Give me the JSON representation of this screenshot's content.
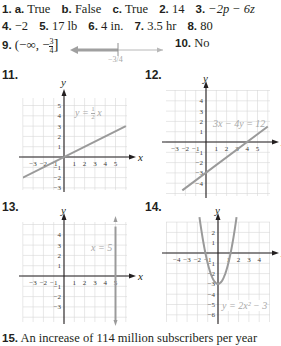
{
  "answers": {
    "line1": [
      {
        "num": "1.",
        "sub": [
          {
            "label": "a.",
            "value": "True"
          },
          {
            "label": "b.",
            "value": "False"
          },
          {
            "label": "c.",
            "value": "True"
          }
        ]
      },
      {
        "num": "2.",
        "value": "14"
      },
      {
        "num": "3.",
        "value": "−2p − 6z"
      }
    ],
    "line2": [
      {
        "num": "4.",
        "value": "−2"
      },
      {
        "num": "5.",
        "value": "17 lb"
      },
      {
        "num": "6.",
        "value": "4 in."
      },
      {
        "num": "7.",
        "value": "3.5 hr"
      },
      {
        "num": "8.",
        "value": "80"
      }
    ],
    "line3": {
      "q9": {
        "num": "9.",
        "value": "(−∞, −3/4]",
        "interval_open": "(−∞, −",
        "frac_num": "3",
        "frac_den": "4",
        "interval_close": "]",
        "numberline_label": "−3/4"
      },
      "q10": {
        "num": "10.",
        "value": "No"
      }
    },
    "q15": {
      "num": "15.",
      "value": "An increase of 114 million subscribers per year"
    }
  },
  "chart_data": [
    {
      "id": "11",
      "type": "line",
      "title": "11.",
      "equation": "y = 1/2 x",
      "eq_num": "1",
      "eq_den": "2",
      "xlabel": "x",
      "ylabel": "y",
      "xlim": [
        -3.5,
        5.8
      ],
      "ylim": [
        -3.5,
        5.8
      ],
      "xticks": [
        -3,
        -2,
        -1,
        1,
        2,
        3,
        4,
        5
      ],
      "yticks": [
        -3,
        -2,
        -1,
        1,
        2,
        3,
        4,
        5
      ],
      "x": [
        -4,
        6
      ],
      "y": [
        -2,
        3
      ],
      "grid": true
    },
    {
      "id": "12",
      "type": "line",
      "title": "12.",
      "equation": "3x − 4y = 12",
      "xlabel": "x",
      "ylabel": "y",
      "xlim": [
        -3.5,
        5.8
      ],
      "ylim": [
        -5,
        4.8
      ],
      "xticks": [
        -3,
        -2,
        -1,
        1,
        2,
        3,
        4,
        5
      ],
      "yticks": [
        -4,
        -3,
        -2,
        -1,
        1,
        2,
        3,
        4
      ],
      "x": [
        -2.3,
        6
      ],
      "y": [
        -4.7,
        1.5
      ],
      "grid": true
    },
    {
      "id": "13",
      "type": "line",
      "title": "13.",
      "equation": "x = 5",
      "xlabel": "x",
      "ylabel": "y",
      "xlim": [
        -3.5,
        5.8
      ],
      "ylim": [
        -4.5,
        5
      ],
      "xticks": [
        -3,
        -2,
        -1,
        1,
        2,
        3,
        4,
        5
      ],
      "yticks": [
        -3,
        -2,
        -1,
        1,
        2,
        3,
        4
      ],
      "x": [
        5,
        5
      ],
      "y": [
        -4.5,
        4.8
      ],
      "grid": true
    },
    {
      "id": "14",
      "type": "line",
      "title": "14.",
      "equation": "y = 2x² − 3",
      "xlabel": "x",
      "ylabel": "y",
      "xlim": [
        -4.8,
        4.8
      ],
      "ylim": [
        -6.8,
        3.3
      ],
      "xticks": [
        -4,
        -3,
        -2,
        -1,
        1,
        2,
        3,
        4
      ],
      "yticks": [
        -6,
        -5,
        -4,
        -3,
        -2,
        -1,
        1,
        2
      ],
      "x": [
        -1.8,
        -1.5,
        -1,
        -0.5,
        0,
        0.5,
        1,
        1.5,
        1.8
      ],
      "y": [
        3.48,
        1.5,
        -1,
        -2.5,
        -3,
        -2.5,
        -1,
        1.5,
        3.48
      ],
      "grid": true
    }
  ]
}
